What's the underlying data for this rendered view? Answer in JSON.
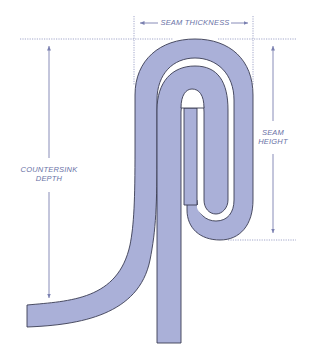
{
  "labels": {
    "seam_thickness": "SEAM THICKNESS",
    "seam_height_line1": "SEAM",
    "seam_height_line2": "HEIGHT",
    "countersink_line1": "COUNTERSINK",
    "countersink_line2": "DEPTH"
  },
  "colors": {
    "metal_fill": "#aab0d8",
    "metal_stroke": "#3a3c52",
    "dimension_line": "#7a80b0",
    "label_text": "#6a72a6",
    "background": "#ffffff"
  },
  "dimensions": [
    {
      "name": "seam_thickness",
      "orientation": "horizontal"
    },
    {
      "name": "seam_height",
      "orientation": "vertical"
    },
    {
      "name": "countersink_depth",
      "orientation": "vertical"
    }
  ]
}
